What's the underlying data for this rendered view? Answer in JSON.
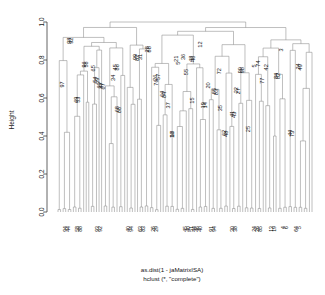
{
  "chart_data": {
    "type": "tree",
    "title": "",
    "subtitle": "",
    "xlabel": "as.dist(1 - jaMatrixISA)",
    "ylabel": "Height",
    "caption_line1": "as.dist(1 - jaMatrixISA)",
    "caption_line2": "hclust (*, \"complete\")",
    "method": "complete",
    "distance": "as.dist(1 - jaMatrixISA)",
    "ylim": [
      0.0,
      1.0
    ],
    "yticks": [
      "0.0",
      "0.2",
      "0.4",
      "0.6",
      "0.8",
      "1.0"
    ],
    "ytick_values": [
      0.0,
      0.2,
      0.4,
      0.6,
      0.8,
      1.0
    ],
    "grid": false,
    "legend": "none",
    "root_height": 1.0,
    "n_leaves": 100,
    "line_color": "#8a8a8a",
    "axis_color": "#3c3c3c",
    "text_color": "#111111",
    "background": "#ffffff",
    "node_labels": [
      {
        "text": "97",
        "x": 62,
        "h": 0.655
      },
      {
        "text": "98",
        "x": 69,
        "h": 0.885
      },
      {
        "text": "92",
        "x": 71,
        "h": 0.885
      },
      {
        "text": "69",
        "x": 76,
        "h": 0.575
      },
      {
        "text": "53",
        "x": 78,
        "h": 0.575
      },
      {
        "text": "96",
        "x": 84,
        "h": 0.76
      },
      {
        "text": "56",
        "x": 86,
        "h": 0.76
      },
      {
        "text": "65",
        "x": 93,
        "h": 0.74
      },
      {
        "text": "54",
        "x": 95,
        "h": 0.68
      },
      {
        "text": "59",
        "x": 97,
        "h": 0.675
      },
      {
        "text": "60",
        "x": 99,
        "h": 0.65
      },
      {
        "text": "47",
        "x": 101,
        "h": 0.65
      },
      {
        "text": "67",
        "x": 103,
        "h": 0.645
      },
      {
        "text": "34",
        "x": 113,
        "h": 0.69
      },
      {
        "text": "45",
        "x": 115,
        "h": 0.745
      },
      {
        "text": "86",
        "x": 117,
        "h": 0.745
      },
      {
        "text": "68",
        "x": 117,
        "h": 0.525
      },
      {
        "text": "66",
        "x": 119,
        "h": 0.52
      },
      {
        "text": "99",
        "x": 135,
        "h": 0.8
      },
      {
        "text": "31",
        "x": 140,
        "h": 0.8
      },
      {
        "text": "87",
        "x": 137,
        "h": 0.795
      },
      {
        "text": "28",
        "x": 147,
        "h": 0.84
      },
      {
        "text": "88",
        "x": 149,
        "h": 0.84
      },
      {
        "text": "26",
        "x": 155,
        "h": 0.69
      },
      {
        "text": "57",
        "x": 158,
        "h": 0.695
      },
      {
        "text": "76",
        "x": 156,
        "h": 0.665
      },
      {
        "text": "64",
        "x": 162,
        "h": 0.605
      },
      {
        "text": "84",
        "x": 164,
        "h": 0.6
      },
      {
        "text": "37",
        "x": 168,
        "h": 0.545
      },
      {
        "text": "18",
        "x": 172,
        "h": 0.395
      },
      {
        "text": "16",
        "x": 172,
        "h": 0.39
      },
      {
        "text": "21",
        "x": 176,
        "h": 0.79
      },
      {
        "text": "5",
        "x": 178,
        "h": 0.775
      },
      {
        "text": "36",
        "x": 183,
        "h": 0.8
      },
      {
        "text": "48",
        "x": 191,
        "h": 0.79
      },
      {
        "text": "46",
        "x": 193,
        "h": 0.79
      },
      {
        "text": "55",
        "x": 186,
        "h": 0.72
      },
      {
        "text": "15",
        "x": 192,
        "h": 0.57
      },
      {
        "text": "12",
        "x": 200,
        "h": 0.865
      },
      {
        "text": "19",
        "x": 203,
        "h": 0.545
      },
      {
        "text": "14",
        "x": 205,
        "h": 0.545
      },
      {
        "text": "20",
        "x": 208,
        "h": 0.65
      },
      {
        "text": "85",
        "x": 214,
        "h": 0.62
      },
      {
        "text": "83",
        "x": 216,
        "h": 0.615
      },
      {
        "text": "72",
        "x": 219,
        "h": 0.725
      },
      {
        "text": "35",
        "x": 220,
        "h": 0.53
      },
      {
        "text": "62",
        "x": 224,
        "h": 0.4
      },
      {
        "text": "48",
        "x": 226,
        "h": 0.395
      },
      {
        "text": "41",
        "x": 232,
        "h": 0.5
      },
      {
        "text": "43",
        "x": 234,
        "h": 0.495
      },
      {
        "text": "22",
        "x": 236,
        "h": 0.625
      },
      {
        "text": "27",
        "x": 238,
        "h": 0.62
      },
      {
        "text": "90",
        "x": 240,
        "h": 0.73
      },
      {
        "text": "98",
        "x": 242,
        "h": 0.73
      },
      {
        "text": "25",
        "x": 248,
        "h": 0.42
      },
      {
        "text": "5",
        "x": 254,
        "h": 0.76
      },
      {
        "text": "74",
        "x": 258,
        "h": 0.765
      },
      {
        "text": "77",
        "x": 262,
        "h": 0.675
      },
      {
        "text": "42",
        "x": 266,
        "h": 0.745
      },
      {
        "text": "84",
        "x": 276,
        "h": 0.7
      },
      {
        "text": "82",
        "x": 278,
        "h": 0.7
      },
      {
        "text": "3",
        "x": 281,
        "h": 0.845
      },
      {
        "text": "44",
        "x": 290,
        "h": 0.4
      },
      {
        "text": "73",
        "x": 292,
        "h": 0.395
      },
      {
        "text": "24",
        "x": 298,
        "h": 0.75
      },
      {
        "text": "49",
        "x": 300,
        "h": 0.745
      }
    ],
    "leaf_labels": [
      {
        "text": "94",
        "x": 65
      },
      {
        "text": "44",
        "x": 68
      },
      {
        "text": "58",
        "x": 77
      },
      {
        "text": "88",
        "x": 80
      },
      {
        "text": "93",
        "x": 97
      },
      {
        "text": "92",
        "x": 100
      },
      {
        "text": "40",
        "x": 128
      },
      {
        "text": "94",
        "x": 131
      },
      {
        "text": "63",
        "x": 140
      },
      {
        "text": "83",
        "x": 143
      },
      {
        "text": "26",
        "x": 153
      },
      {
        "text": "29",
        "x": 156
      },
      {
        "text": "45",
        "x": 185
      },
      {
        "text": "40",
        "x": 188
      },
      {
        "text": "51",
        "x": 191
      },
      {
        "text": "44",
        "x": 194
      },
      {
        "text": "46",
        "x": 197
      },
      {
        "text": "40",
        "x": 200
      },
      {
        "text": "91",
        "x": 211
      },
      {
        "text": "94",
        "x": 214
      },
      {
        "text": "30",
        "x": 232
      },
      {
        "text": "38",
        "x": 235
      },
      {
        "text": "24",
        "x": 254
      },
      {
        "text": "26",
        "x": 257
      },
      {
        "text": "85",
        "x": 260
      },
      {
        "text": "13",
        "x": 271
      },
      {
        "text": "19",
        "x": 274
      },
      {
        "text": "4",
        "x": 283
      },
      {
        "text": "6",
        "x": 286
      },
      {
        "text": "64",
        "x": 296
      },
      {
        "text": "5",
        "x": 299
      }
    ]
  },
  "plot": {
    "y_axis_title": "Height",
    "tick_0": "0.0",
    "tick_1": "0.2",
    "tick_2": "0.4",
    "tick_3": "0.6",
    "tick_4": "0.8",
    "tick_5": "1.0",
    "caption_1": "as.dist(1 - jaMatrixISA)",
    "caption_2": "hclust (*, \"complete\")"
  }
}
